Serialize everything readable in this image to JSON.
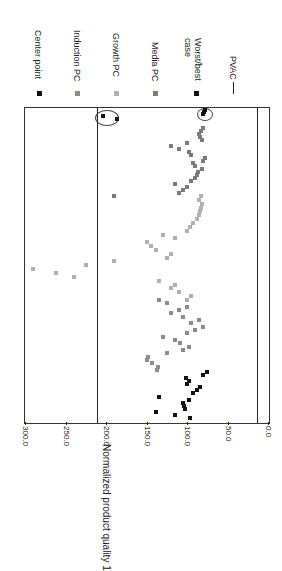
{
  "chart_data": {
    "type": "scatter",
    "orientation": "rotated 90 degrees clockwise",
    "title": "",
    "xlabel": "",
    "ylabel": "Normalized product quality 1",
    "ylim": [
      0,
      300
    ],
    "yticks": [
      "0.0",
      "50.0",
      "100.0",
      "150.0",
      "200.0",
      "250.0",
      "300.0"
    ],
    "grid": false,
    "legend_position": "right (top of page)",
    "legend": [
      "Center point",
      "Induction PC",
      "Growth  PC",
      "Media PC",
      "Worst/best case",
      "PVAC"
    ],
    "pvac_limits": [
      210,
      12
    ],
    "series": [
      {
        "name": "Center point",
        "color": "#111111",
        "values": [
          96,
          115,
          138,
          103,
          104,
          105,
          98,
          135,
          93,
          88,
          84,
          100,
          97,
          101,
          80,
          75
        ]
      },
      {
        "name": "Induction PC",
        "color": "#8c8c8c",
        "values": [
          137,
          136,
          143,
          150,
          148,
          125,
          105,
          97,
          109,
          115,
          130,
          100,
          90,
          80,
          95,
          85,
          105,
          120,
          110,
          100,
          125,
          135
        ]
      },
      {
        "name": "Growth  PC",
        "color": "#b0b0b0",
        "values": [
          100,
          95,
          110,
          120,
          115,
          135,
          240,
          262,
          290,
          225,
          190,
          125,
          120,
          138,
          145,
          150,
          115,
          130,
          100,
          96,
          92,
          88,
          85,
          84,
          83,
          82,
          85,
          83
        ]
      },
      {
        "name": "Media PC",
        "color": "#7a7a7a",
        "values": [
          190,
          110,
          105,
          100,
          115,
          95,
          90,
          88,
          86,
          82,
          90,
          92,
          80,
          78,
          95,
          98,
          110,
          120,
          100,
          82,
          84,
          85,
          83,
          80
        ]
      },
      {
        "name": "Worst/best case",
        "color": "#111111",
        "values": [
          204,
          187,
          80,
          79,
          78
        ]
      }
    ]
  },
  "legend": {
    "center_point": "Center point",
    "induction_pc": "Induction PC",
    "growth_pc": "Growth  PC",
    "media_pc": "Media PC",
    "worst_best_1": "Worst/best",
    "worst_best_2": "case",
    "pvac": "PVAC"
  },
  "axis": {
    "label": "Normalized product quality 1",
    "ticks": [
      "300.0",
      "250.0",
      "200.0",
      "150.0",
      "100.0",
      "50.0",
      "0.0"
    ]
  }
}
